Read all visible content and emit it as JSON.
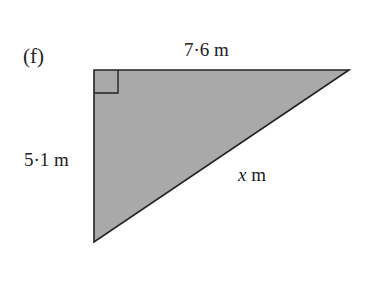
{
  "figure": {
    "part_label": "(f)",
    "top_side": "7·6 m",
    "left_side": "5·1 m",
    "hypotenuse_var": "x",
    "hypotenuse_unit": " m",
    "fill_color": "#a9a9a9",
    "stroke_color": "#222222",
    "right_angle_marker": true
  }
}
